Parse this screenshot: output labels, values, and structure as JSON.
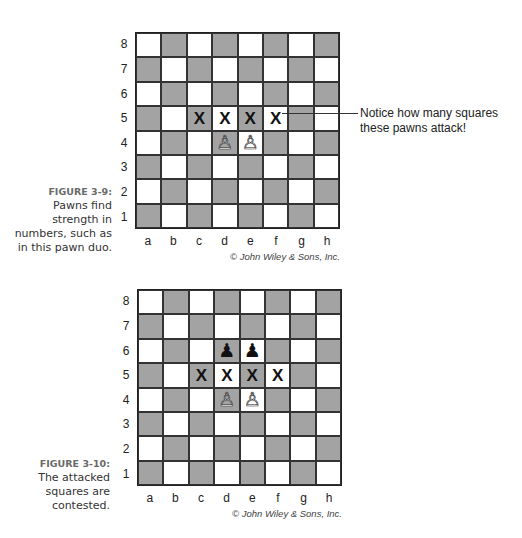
{
  "figures": [
    {
      "id": "fig-3-9",
      "caption_label": "FIGURE 3-9:",
      "caption_lines": [
        "Pawns find",
        "strength in",
        "numbers, such as",
        "in this pawn duo."
      ],
      "copyright": "© John Wiley & Sons, Inc.",
      "ranks": [
        "8",
        "7",
        "6",
        "5",
        "4",
        "3",
        "2",
        "1"
      ],
      "files": [
        "a",
        "b",
        "c",
        "d",
        "e",
        "f",
        "g",
        "h"
      ],
      "pieces": [
        {
          "square": "d4",
          "piece": "white-pawn",
          "glyph": "♙"
        },
        {
          "square": "e4",
          "piece": "white-pawn",
          "glyph": "♙"
        }
      ],
      "markers": [
        {
          "square": "c5",
          "label": "X"
        },
        {
          "square": "d5",
          "label": "X"
        },
        {
          "square": "e5",
          "label": "X"
        },
        {
          "square": "f5",
          "label": "X"
        }
      ],
      "callout": {
        "lines": [
          "Notice how many squares",
          "these pawns attack!"
        ],
        "points_to": "f5"
      }
    },
    {
      "id": "fig-3-10",
      "caption_label": "FIGURE 3-10:",
      "caption_lines": [
        "The attacked",
        "squares are",
        "contested."
      ],
      "copyright": "© John Wiley & Sons, Inc.",
      "ranks": [
        "8",
        "7",
        "6",
        "5",
        "4",
        "3",
        "2",
        "1"
      ],
      "files": [
        "a",
        "b",
        "c",
        "d",
        "e",
        "f",
        "g",
        "h"
      ],
      "pieces": [
        {
          "square": "d6",
          "piece": "black-pawn",
          "glyph": "♟"
        },
        {
          "square": "e6",
          "piece": "black-pawn",
          "glyph": "♟"
        },
        {
          "square": "d4",
          "piece": "white-pawn",
          "glyph": "♙"
        },
        {
          "square": "e4",
          "piece": "white-pawn",
          "glyph": "♙"
        }
      ],
      "markers": [
        {
          "square": "c5",
          "label": "X"
        },
        {
          "square": "d5",
          "label": "X"
        },
        {
          "square": "e5",
          "label": "X"
        },
        {
          "square": "f5",
          "label": "X"
        }
      ]
    }
  ],
  "colors": {
    "light_square": "#ffffff",
    "dark_square": "#a3a3a3",
    "caption_label": "#6a6a6a"
  }
}
